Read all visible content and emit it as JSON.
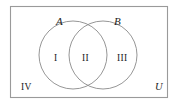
{
  "figure": {
    "type": "venn-diagram",
    "background_color": "#ffffff",
    "stroke_color": "#8a8a8a",
    "rectangle_stroke_color": "#9a9a9a",
    "text_color": "#1c1c1c"
  },
  "sets": {
    "left_circle_label": "A",
    "right_circle_label": "B",
    "universe_label": "U"
  },
  "regions": [
    {
      "id": "region-1",
      "label": "I",
      "meaning": "A only"
    },
    {
      "id": "region-2",
      "label": "II",
      "meaning": "A intersect B"
    },
    {
      "id": "region-3",
      "label": "III",
      "meaning": "B only"
    },
    {
      "id": "region-4",
      "label": "IV",
      "meaning": "outside A and B"
    }
  ],
  "geometry": {
    "rect": {
      "x": 10.5,
      "y": 6.5,
      "width": 157,
      "height": 91
    },
    "circle_a": {
      "cx": 73,
      "cy": 55,
      "r": 34
    },
    "circle_b": {
      "cx": 103,
      "cy": 55,
      "r": 34
    }
  }
}
